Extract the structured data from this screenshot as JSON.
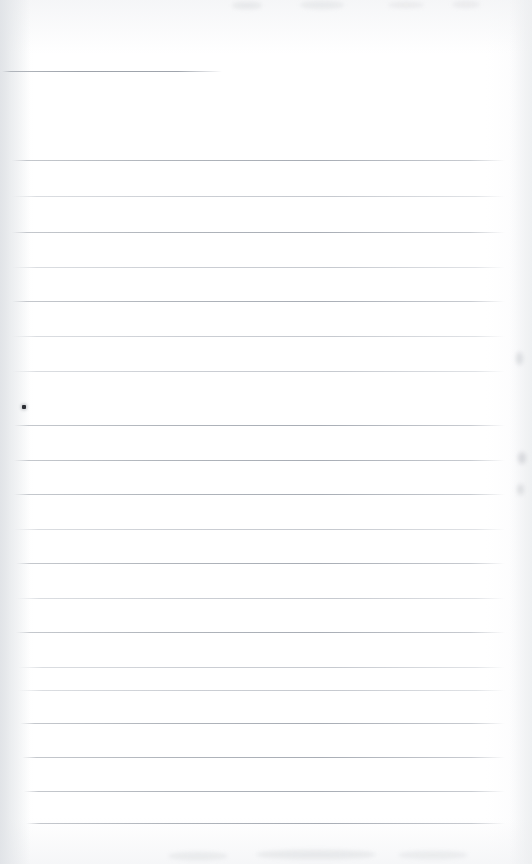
{
  "document": {
    "type": "scanned-ruled-notebook-page",
    "title": "Blank ruled notebook page",
    "page_width": 532,
    "page_height": 864,
    "background_color": "#ffffff",
    "content_text": "",
    "has_handwriting": false
  },
  "paper": {
    "rule_color": "#acb1b8",
    "rule_color_faint": "#bec2c9",
    "paper_tint": "#fdfdfe",
    "gutter_shadow_color": "#dee1e5",
    "edge_shadow_color": "#ebedef"
  },
  "header_rule": {
    "label": "header-rule",
    "x": 2,
    "y": 71,
    "width": 220
  },
  "ruled_lines": [
    {
      "y": 160,
      "x": 12,
      "width": 493,
      "weight": "normal"
    },
    {
      "y": 196,
      "x": 12,
      "width": 493,
      "weight": "faint"
    },
    {
      "y": 232,
      "x": 12,
      "width": 493,
      "weight": "normal"
    },
    {
      "y": 267,
      "x": 12,
      "width": 493,
      "weight": "faint"
    },
    {
      "y": 301,
      "x": 12,
      "width": 493,
      "weight": "normal"
    },
    {
      "y": 336,
      "x": 12,
      "width": 493,
      "weight": "faint"
    },
    {
      "y": 371,
      "x": 12,
      "width": 493,
      "weight": "faint"
    },
    {
      "y": 425,
      "x": 14,
      "width": 491,
      "weight": "normal"
    },
    {
      "y": 460,
      "x": 14,
      "width": 491,
      "weight": "normal"
    },
    {
      "y": 494,
      "x": 14,
      "width": 491,
      "weight": "normal"
    },
    {
      "y": 529,
      "x": 14,
      "width": 491,
      "weight": "faint"
    },
    {
      "y": 563,
      "x": 16,
      "width": 489,
      "weight": "normal"
    },
    {
      "y": 598,
      "x": 16,
      "width": 489,
      "weight": "faint"
    },
    {
      "y": 632,
      "x": 16,
      "width": 489,
      "weight": "normal"
    },
    {
      "y": 667,
      "x": 18,
      "width": 487,
      "weight": "faint"
    },
    {
      "y": 690,
      "x": 18,
      "width": 487,
      "weight": "faint"
    },
    {
      "y": 723,
      "x": 20,
      "width": 485,
      "weight": "normal"
    },
    {
      "y": 757,
      "x": 22,
      "width": 483,
      "weight": "normal"
    },
    {
      "y": 791,
      "x": 24,
      "width": 481,
      "weight": "normal"
    },
    {
      "y": 823,
      "x": 26,
      "width": 479,
      "weight": "normal"
    }
  ],
  "marks": [
    {
      "name": "ink-dot",
      "x": 22,
      "y": 405,
      "size": 4,
      "color": "#2b2e33"
    }
  ],
  "scan_artifacts": [
    {
      "name": "edge-smudge-right-upper",
      "x": 516,
      "y": 352,
      "w": 7,
      "h": 13,
      "opacity": 0.3
    },
    {
      "name": "edge-smudge-right-mid",
      "x": 518,
      "y": 452,
      "w": 8,
      "h": 12,
      "opacity": 0.34
    },
    {
      "name": "edge-smudge-right-lower",
      "x": 517,
      "y": 484,
      "w": 7,
      "h": 11,
      "opacity": 0.28
    },
    {
      "name": "top-smudge-a",
      "x": 232,
      "y": 2,
      "w": 30,
      "h": 7,
      "opacity": 0.18
    },
    {
      "name": "top-smudge-b",
      "x": 300,
      "y": 1,
      "w": 44,
      "h": 8,
      "opacity": 0.16
    },
    {
      "name": "top-smudge-c",
      "x": 388,
      "y": 2,
      "w": 36,
      "h": 6,
      "opacity": 0.14
    },
    {
      "name": "top-smudge-d",
      "x": 452,
      "y": 1,
      "w": 28,
      "h": 7,
      "opacity": 0.13
    },
    {
      "name": "bottom-smudge-a",
      "x": 168,
      "y": 852,
      "w": 60,
      "h": 8,
      "opacity": 0.16
    },
    {
      "name": "bottom-smudge-b",
      "x": 256,
      "y": 850,
      "w": 120,
      "h": 9,
      "opacity": 0.18
    },
    {
      "name": "bottom-smudge-c",
      "x": 398,
      "y": 851,
      "w": 70,
      "h": 8,
      "opacity": 0.15
    }
  ]
}
